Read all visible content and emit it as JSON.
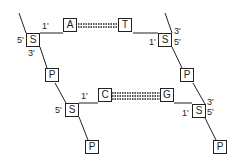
{
  "diagram": {
    "title": "",
    "pair1": {
      "base_left": "A",
      "base_right": "T",
      "hydrogen_bonds": 2,
      "left_sugar": {
        "label": "S",
        "prime_5": "5'",
        "prime_1": "1'",
        "prime_3": "3'"
      },
      "right_sugar": {
        "label": "S",
        "prime_1": "1'",
        "prime_3": "3'",
        "prime_5": "5'"
      }
    },
    "pair2": {
      "base_left": "C",
      "base_right": "G",
      "hydrogen_bonds": 3,
      "left_sugar": {
        "label": "S",
        "prime_5": "5'",
        "prime_1": "1'"
      },
      "right_sugar": {
        "label": "S",
        "prime_1": "1'",
        "prime_3": "3'",
        "prime_5": "5'"
      }
    },
    "phosphates": [
      "P",
      "P",
      "P",
      "P"
    ],
    "colors": {
      "line": "#222222",
      "background": "#ffffff"
    }
  }
}
